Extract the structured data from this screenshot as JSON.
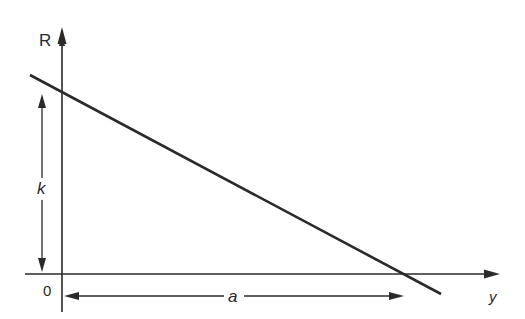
{
  "diagram": {
    "type": "linear relationship graph",
    "axes": {
      "vertical": {
        "label": "R"
      },
      "horizontal": {
        "label": "y"
      },
      "origin_label": "0"
    },
    "line": {
      "description": "straight line with negative slope",
      "intercept_vertical_label": "k",
      "intercept_horizontal_label": "a"
    },
    "dimensions": [
      {
        "name": "k",
        "label": "k",
        "orientation": "vertical",
        "meaning": "R-intercept height"
      },
      {
        "name": "a",
        "label": "a",
        "orientation": "horizontal",
        "meaning": "y-intercept distance"
      }
    ],
    "colors": {
      "ink": "#2a2a2a",
      "background": "#ffffff"
    }
  }
}
